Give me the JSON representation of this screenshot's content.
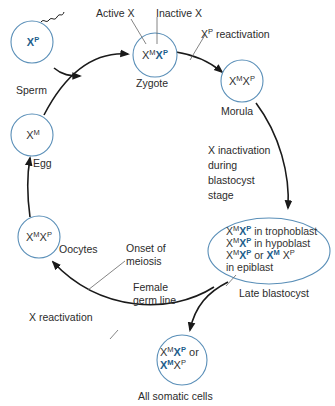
{
  "colors": {
    "circle_stroke": "#5a8fb8",
    "arrow": "#1a1a1a",
    "inactive_x": "#1e5e8c",
    "leader_line": "#666666"
  },
  "nodes": {
    "sperm": {
      "label": "Sperm",
      "genotype": [
        {
          "base": "X",
          "sup": "P",
          "inactive": true
        }
      ]
    },
    "zygote": {
      "label": "Zygote",
      "genotype": [
        {
          "base": "X",
          "sup": "M",
          "inactive": false
        },
        {
          "base": "X",
          "sup": "P",
          "inactive": true
        }
      ]
    },
    "morula": {
      "label": "Morula",
      "genotype": [
        {
          "base": "X",
          "sup": "M",
          "inactive": false
        },
        {
          "base": "X",
          "sup": "P",
          "inactive": false
        }
      ]
    },
    "egg": {
      "label": "Egg",
      "genotype": [
        {
          "base": "X",
          "sup": "M",
          "inactive": false
        }
      ]
    },
    "oocytes": {
      "label": "Oocytes",
      "genotype": [
        {
          "base": "X",
          "sup": "M",
          "inactive": false
        },
        {
          "base": "X",
          "sup": "P",
          "inactive": false
        }
      ]
    },
    "late_blastocyst": {
      "label": "Late blastocyst",
      "lines": [
        {
          "suffix": " in trophoblast"
        },
        {
          "suffix": " in hypoblast"
        },
        {
          "suffix": " or "
        },
        {
          "suffix": "in epiblast"
        }
      ]
    },
    "somatic": {
      "label": "All somatic cells",
      "or_text": " or"
    }
  },
  "annotations": {
    "active_x": "Active X",
    "inactive_x": "Inactive X",
    "xp_reactivation_base": "X",
    "xp_reactivation_sup": "P",
    "xp_reactivation_text": " reactivation",
    "x_inactivation": [
      "X inactivation",
      "during",
      "blastocyst",
      "stage"
    ],
    "onset_meiosis": [
      "Onset of",
      "meiosis"
    ],
    "female_germ_line": [
      "Female",
      "germ line"
    ],
    "x_reactivation": "X reactivation"
  },
  "symbols": {
    "X": "X",
    "M": "M",
    "P": "P"
  }
}
